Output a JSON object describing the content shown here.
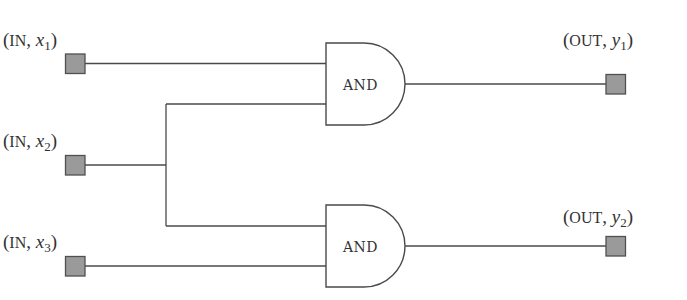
{
  "diagram": {
    "type": "logic-circuit",
    "colors": {
      "wire": "#4a4a4a",
      "port_fill": "#9a9a9a",
      "port_stroke": "#505050",
      "gate_stroke": "#4a4a4a",
      "text": "#333333",
      "background": "#ffffff"
    },
    "inputs": [
      {
        "id": "x1",
        "kind": "IN",
        "var": "x",
        "sub": "1"
      },
      {
        "id": "x2",
        "kind": "IN",
        "var": "x",
        "sub": "2"
      },
      {
        "id": "x3",
        "kind": "IN",
        "var": "x",
        "sub": "3"
      }
    ],
    "outputs": [
      {
        "id": "y1",
        "kind": "OUT",
        "var": "y",
        "sub": "1"
      },
      {
        "id": "y2",
        "kind": "OUT",
        "var": "y",
        "sub": "2"
      }
    ],
    "gates": [
      {
        "id": "g1",
        "label": "AND",
        "inputs": [
          "x1",
          "x2"
        ],
        "output": "y1"
      },
      {
        "id": "g2",
        "label": "AND",
        "inputs": [
          "x2",
          "x3"
        ],
        "output": "y2"
      }
    ],
    "punct": {
      "open": "(",
      "comma": ", ",
      "close": ")"
    }
  }
}
